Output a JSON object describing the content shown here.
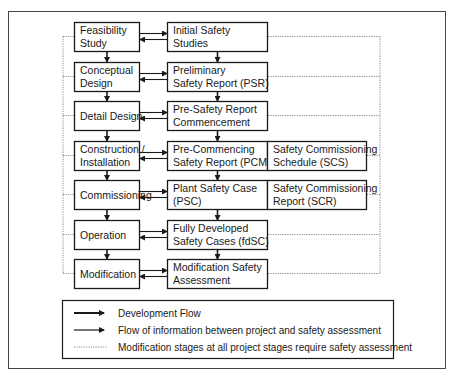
{
  "diagram": {
    "project_stages": [
      {
        "lines": [
          "Feasibility",
          "Study"
        ]
      },
      {
        "lines": [
          "Conceptual",
          "Design"
        ]
      },
      {
        "lines": [
          "Detail Design"
        ]
      },
      {
        "lines": [
          "Construction /",
          "Installation"
        ]
      },
      {
        "lines": [
          "Commissioning"
        ]
      },
      {
        "lines": [
          "Operation"
        ]
      },
      {
        "lines": [
          "Modification"
        ]
      }
    ],
    "safety_stages": [
      {
        "lines": [
          "Initial Safety",
          "Studies"
        ]
      },
      {
        "lines": [
          "Preliminary",
          "Safety Report (PSR)"
        ]
      },
      {
        "lines": [
          "Pre-Safety Report",
          "Commencement"
        ]
      },
      {
        "lines": [
          "Pre-Commencing",
          "Safety Report (PCMSR)"
        ]
      },
      {
        "lines": [
          "Plant Safety Case",
          "(PSC)"
        ]
      },
      {
        "lines": [
          "Fully Developed",
          "Safety Cases (fdSC)"
        ]
      },
      {
        "lines": [
          "Modification Safety",
          "Assessment"
        ]
      }
    ],
    "commissioning_docs": [
      {
        "row": 3,
        "lines": [
          "Safety Commissioning",
          "Schedule (SCS)"
        ]
      },
      {
        "row": 4,
        "lines": [
          "Safety Commissioning",
          "Report (SCR)"
        ]
      }
    ],
    "legend": [
      {
        "style": "thick-arrow",
        "label": "Development Flow"
      },
      {
        "style": "thin-arrow",
        "label": "Flow of information between project and safety assessment"
      },
      {
        "style": "dotted-line",
        "label": "Modification stages at all project stages require safety assessment"
      }
    ]
  }
}
